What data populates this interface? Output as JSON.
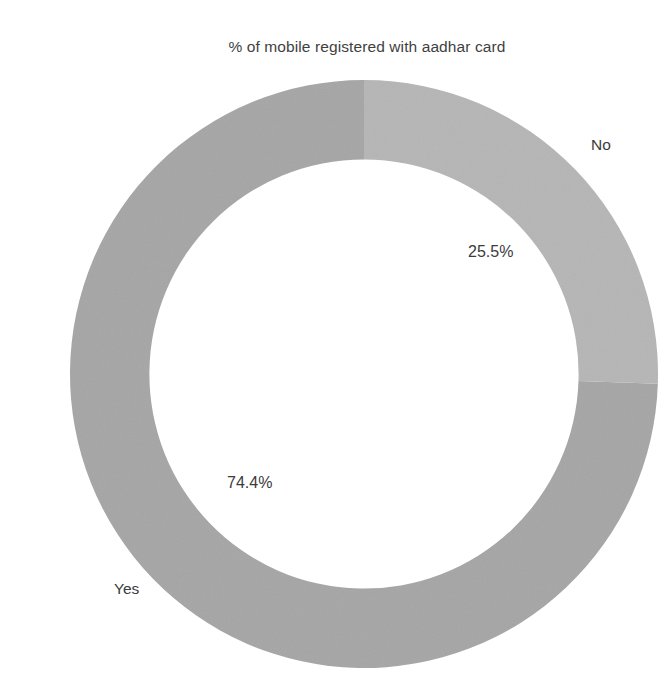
{
  "chart_data": {
    "type": "pie",
    "variant": "donut",
    "title": "% of mobile registered with aadhar card",
    "xlabel": "",
    "ylabel": "",
    "legend": "none",
    "grid": false,
    "unit": "%",
    "hole_ratio": 0.73,
    "start_angle_deg": 0,
    "direction": "clockwise",
    "categories": [
      "No",
      "Yes"
    ],
    "values": [
      25.5,
      74.4
    ],
    "labels": [
      "25.5%",
      "74.4%"
    ],
    "colors": [
      "#b6b6b6",
      "#a6a6a6"
    ],
    "slices": [
      {
        "name": "No",
        "value": 25.5,
        "value_label": "25.5%",
        "color": "#b6b6b6",
        "start_angle_deg": 0,
        "sweep_deg": 91.8
      },
      {
        "name": "Yes",
        "value": 74.4,
        "value_label": "74.4%",
        "color": "#a6a6a6",
        "start_angle_deg": 91.8,
        "sweep_deg": 268.2
      }
    ]
  },
  "chart": {
    "title": "% of mobile registered with aadhar card",
    "labels": {
      "no_category": "No",
      "no_value": "25.5%",
      "yes_category": "Yes",
      "yes_value": "74.4%"
    },
    "colors": {
      "slice_no": "#b6b6b6",
      "slice_yes": "#a6a6a6",
      "background": "#ffffff",
      "text": "#3b3b3b"
    }
  }
}
